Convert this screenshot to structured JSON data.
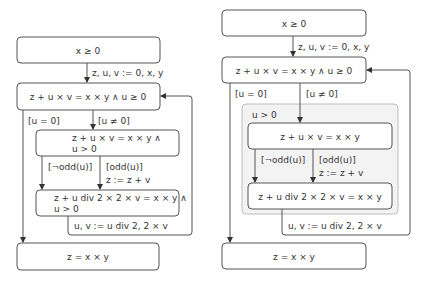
{
  "left": {
    "start": "x ≥ 0",
    "init": "z, u, v := 0, x, y",
    "invariant": "z + u × v = x × y ∧ u ≥ 0",
    "guard_exit": "[u = 0]",
    "guard_loop": "[u ≠ 0]",
    "body_line1": "z + u × v = x × y ∧",
    "body_line2": "u > 0",
    "guard_even": "[¬odd(u)]",
    "guard_odd": "[odd(u)]",
    "odd_assign": "z := z + v",
    "after_line1": "z + u div 2 × 2 × v = x × y ∧",
    "after_line2": "u > 0",
    "update": "u, v := u div 2, 2 × v",
    "end": "z = x × y"
  },
  "right": {
    "start": "x ≥ 0",
    "init": "z, u, v := 0, x, y",
    "invariant": "z + u × v = x × y ∧ u ≥ 0",
    "guard_exit": "[u = 0]",
    "guard_loop": "[u ≠ 0]",
    "group_label": "u > 0",
    "body": "z + u × v = x × y",
    "guard_even": "[¬odd(u)]",
    "guard_odd": "[odd(u)]",
    "odd_assign": "z := z + v",
    "after": "z + u div 2 × 2 × v = x × y",
    "update": "u, v := u div 2, 2 × v",
    "end": "z = x × y"
  },
  "colors": {
    "stroke": "#555555",
    "group_fill": "#f3f3f3",
    "group_stroke": "#bdbdbd",
    "text": "#333333"
  }
}
